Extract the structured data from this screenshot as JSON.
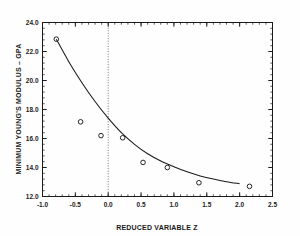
{
  "chart_data": {
    "type": "scatter",
    "title": "",
    "xlabel": "REDUCED VARIABLE  Z",
    "ylabel": "MINIMUM YOUNG'S MODULUS – GPA",
    "xlim": [
      -1.0,
      2.5
    ],
    "ylim": [
      12.0,
      24.0
    ],
    "xticks": [
      -1.0,
      -0.5,
      0.0,
      0.5,
      1.0,
      1.5,
      2.0,
      2.5
    ],
    "xticklabels": [
      "-1.0",
      "-0.5",
      "0.0",
      "0.5",
      "1.0",
      "1.5",
      "2.0",
      "2.5"
    ],
    "yticks": [
      12.0,
      14.0,
      16.0,
      18.0,
      20.0,
      22.0,
      24.0
    ],
    "yticklabels": [
      "12.0",
      "14.0",
      "16.0",
      "18.0",
      "20.0",
      "22.0",
      "24.0"
    ],
    "x_minor_step": 0.1,
    "y_minor_step": 0.4,
    "grid": false,
    "legend": null,
    "marker": "open-circle",
    "marker_color": "#1a1a1a",
    "line_color": "#1a1a1a",
    "reference_line": {
      "orientation": "vertical",
      "value": 0.0,
      "style": "dotted",
      "color": "#555555"
    },
    "points": [
      {
        "x": -0.79,
        "y": 22.85
      },
      {
        "x": -0.42,
        "y": 17.15
      },
      {
        "x": -0.11,
        "y": 16.2
      },
      {
        "x": 0.22,
        "y": 16.05
      },
      {
        "x": 0.53,
        "y": 14.35
      },
      {
        "x": 0.9,
        "y": 14.0
      },
      {
        "x": 1.38,
        "y": 12.95
      },
      {
        "x": 2.15,
        "y": 12.7
      }
    ],
    "fit_curve": {
      "name": "fitted curve",
      "x": [
        -0.79,
        -0.6,
        -0.4,
        -0.2,
        0.0,
        0.2,
        0.4,
        0.6,
        0.8,
        1.0,
        1.2,
        1.4,
        1.6,
        1.8,
        2.0
      ],
      "y": [
        22.85,
        21.3,
        19.85,
        18.55,
        17.4,
        16.4,
        15.6,
        14.95,
        14.45,
        14.05,
        13.7,
        13.42,
        13.2,
        13.02,
        12.88
      ]
    }
  },
  "figure": {
    "background": "#fefefe",
    "frame_color": "#1a1a1a"
  }
}
